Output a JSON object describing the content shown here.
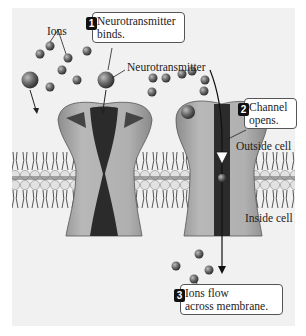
{
  "diagram": {
    "type": "ligand-gated ion channel",
    "labels": {
      "ions": "Ions",
      "neurotransmitter": "Neurotransmitter",
      "outside_cell": "Outside cell",
      "inside_cell": "Inside cell"
    },
    "steps": [
      {
        "number": "1",
        "line1": "Neurotransmitter",
        "line2": "binds."
      },
      {
        "number": "2",
        "line1": "Channel",
        "line2": "opens."
      },
      {
        "number": "3",
        "line1": "Ions flow",
        "line2": "across membrane."
      }
    ],
    "colors": {
      "panel_background": "#f1f1f1",
      "channel_body": "#a9a9a9",
      "pore": "#2b2b2b",
      "membrane_head": "#d8d8d8",
      "membrane_core": "#7a7a7a",
      "ion": "#666666"
    }
  }
}
